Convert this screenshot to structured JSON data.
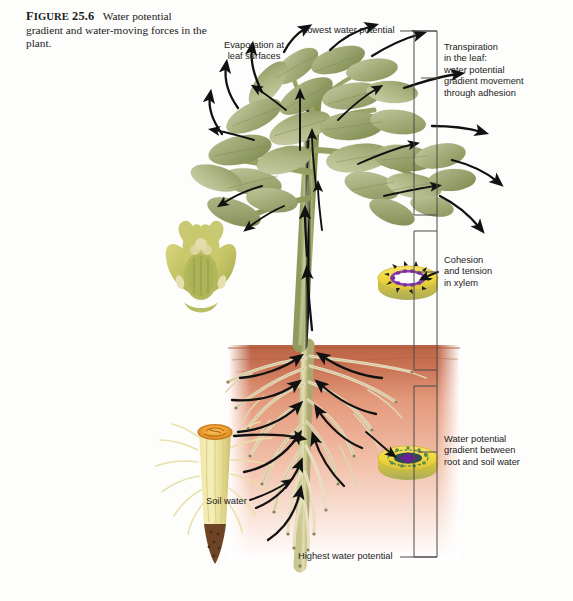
{
  "figure": {
    "number": "FIGURE 25.6",
    "caption": "Water potential gradient and water-moving forces in the plant.",
    "caption_line1": "Water potential gra-",
    "caption_line2": "dient and water-moving forces in the",
    "caption_line3": "plant."
  },
  "labels": {
    "evaporation": "Evaporation at\nleaf surfaces",
    "lowest_potential": "Lowest water potential",
    "transpiration": "Transpiration\nin the leaf:\nwater potential\ngradient movement\nthrough adhesion",
    "cohesion": "Cohesion\nand tension\nin xylem",
    "root_soil_gradient": "Water potential\ngradient between\nroot and soil water",
    "soil_water": "Soil water",
    "highest_potential": "Highest water potential"
  },
  "diagram": {
    "type": "biology-illustration",
    "regions": [
      {
        "name": "leaf-canopy",
        "label": "Transpiration in the leaf: water potential gradient movement through adhesion"
      },
      {
        "name": "stem-xylem",
        "label": "Cohesion and tension in xylem"
      },
      {
        "name": "root-soil",
        "label": "Water potential gradient between root and soil water"
      }
    ],
    "gradient_endpoints": {
      "top": "Lowest water potential",
      "bottom": "Highest water potential"
    }
  },
  "colors": {
    "leaf_light": "#b8bd95",
    "leaf_mid": "#9aa673",
    "leaf_dark": "#7e8c56",
    "stem": "#a8b072",
    "soil_dark": "#b5613f",
    "soil_mid": "#e09273",
    "soil_light": "#f6d2c2",
    "root": "#efe6cf",
    "disc_yellow": "#f3d93f",
    "disc_rim": "#cbbf3a",
    "xylem_purple": "#6c2a8f",
    "flower": "#c6c566",
    "root_core": "#f0a93a",
    "root_cap": "#6b4426",
    "arrow": "#111111",
    "leader": "#4a4a4a"
  }
}
